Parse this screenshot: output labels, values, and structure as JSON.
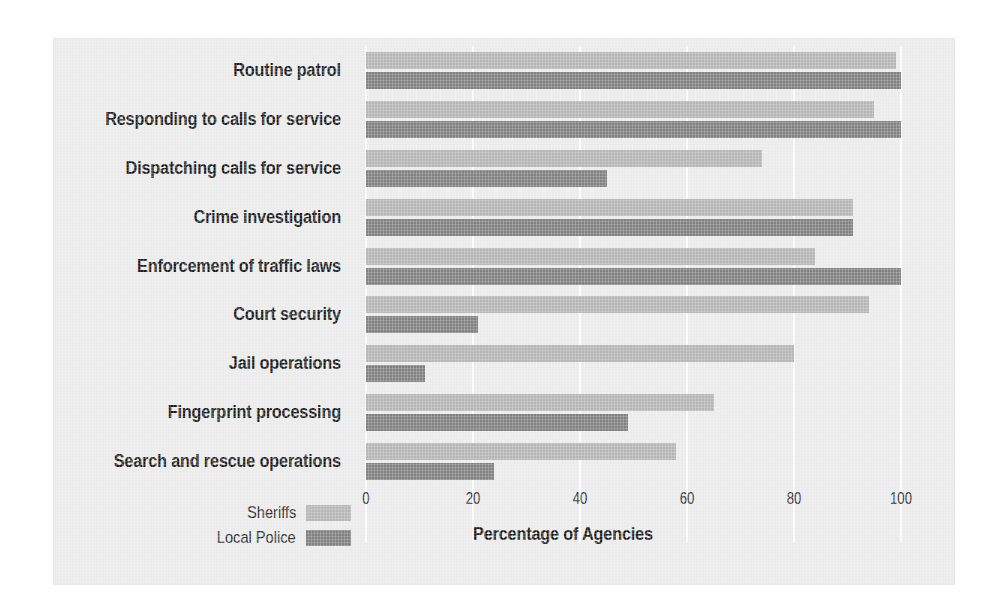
{
  "chart_data": {
    "type": "bar",
    "orientation": "horizontal",
    "title": "",
    "xlabel": "Percentage of Agencies",
    "ylabel": "",
    "xlim": [
      0,
      100
    ],
    "xticks": [
      0,
      20,
      40,
      60,
      80,
      100
    ],
    "grid": true,
    "legend_position": "bottom-left",
    "categories": [
      "Routine patrol",
      "Responding to calls for service",
      "Dispatching calls for service",
      "Crime investigation",
      "Enforcement of traffic laws",
      "Court security",
      "Jail operations",
      "Fingerprint processing",
      "Search and rescue operations"
    ],
    "series": [
      {
        "name": "Sheriffs",
        "color": "#b6b6b6",
        "values": [
          99,
          95,
          74,
          91,
          84,
          94,
          80,
          65,
          58
        ]
      },
      {
        "name": "Local Police",
        "color": "#818181",
        "values": [
          100,
          100,
          45,
          91,
          100,
          21,
          11,
          49,
          24
        ]
      }
    ]
  },
  "legend": {
    "items": [
      {
        "label": "Sheriffs",
        "color": "#b6b6b6"
      },
      {
        "label": "Local Police",
        "color": "#818181"
      }
    ]
  },
  "colors": {
    "panel_background": "#ebebeb",
    "page_background": "#ffffff",
    "gridline": "#fbfbfb",
    "text": "#1b1b1b",
    "sheriffs_bar": "#b6b6b6",
    "local_police_bar": "#818181"
  }
}
